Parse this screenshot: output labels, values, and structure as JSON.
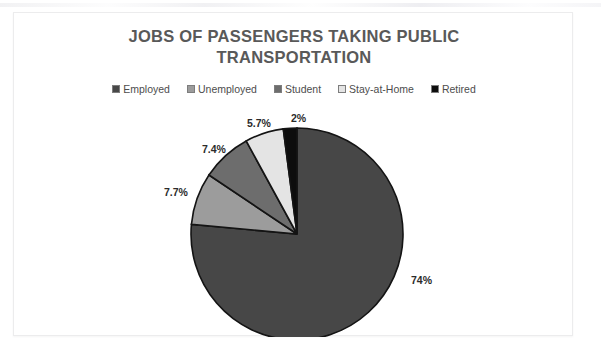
{
  "chart": {
    "title_line1": "JOBS OF PASSENGERS TAKING PUBLIC",
    "title_line2": "TRANSPORTATION",
    "legend_position": "top"
  },
  "chart_data": {
    "type": "pie",
    "title": "JOBS OF PASSENGERS TAKING PUBLIC TRANSPORTATION",
    "xlabel": "",
    "ylabel": "",
    "categories": [
      "Employed",
      "Unemployed",
      "Student",
      "Stay-at-Home",
      "Retired"
    ],
    "values": [
      74,
      7.7,
      7.4,
      5.7,
      2
    ],
    "data_labels": [
      "74%",
      "7.7%",
      "7.4%",
      "5.7%",
      "2%"
    ],
    "colors": [
      "#474747",
      "#9c9c9c",
      "#6d6d6d",
      "#e4e4e4",
      "#0d0d0d"
    ],
    "start_angle_deg": 0,
    "direction": "clockwise",
    "legend": [
      "Employed",
      "Unemployed",
      "Student",
      "Stay-at-Home",
      "Retired"
    ],
    "slice_border_color": "#141414",
    "grid": false
  },
  "legend_items": [
    {
      "label": "Employed",
      "color": "#474747"
    },
    {
      "label": "Unemployed",
      "color": "#9c9c9c"
    },
    {
      "label": "Student",
      "color": "#6d6d6d"
    },
    {
      "label": "Stay-at-Home",
      "color": "#e4e4e4"
    },
    {
      "label": "Retired",
      "color": "#0d0d0d"
    }
  ],
  "labels": {
    "employed": "74%",
    "unemployed": "7.7%",
    "student": "7.4%",
    "stay_at_home": "5.7%",
    "retired": "2%"
  }
}
